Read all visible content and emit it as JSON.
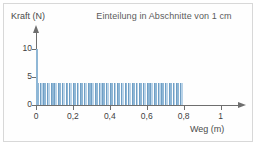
{
  "figure": {
    "width": 257,
    "height": 146,
    "background": "#ffffff",
    "border_color": "#d8d8d8"
  },
  "chart_data": {
    "type": "bar",
    "title": "Einteilung in Abschnitte von 1 cm",
    "xlabel": "Weg (m)",
    "ylabel": "Kraft (N)",
    "xlim": [
      0,
      1.1
    ],
    "ylim": [
      0,
      13
    ],
    "grid": false,
    "legend": null,
    "y_ticks": [
      0,
      5,
      10
    ],
    "y_ticklabels": [
      "0",
      "5",
      "10"
    ],
    "x_ticks": [
      0,
      0.2,
      0.4,
      0.6,
      0.8,
      1.0
    ],
    "x_ticklabels": [
      "0",
      "0,2",
      "0,4",
      "0,6",
      "0,8",
      "1"
    ],
    "bar_fill": "#8fb7d6",
    "bar_fill_alt": "#b9d3e8",
    "bar_edge": "#6f9ec4",
    "axis_color": "#6e6e6e",
    "text_color": "#3f3f3f",
    "title_color": "#5b5b5b",
    "interval_width_m": 0.01,
    "bar_count": 40,
    "bar_height_value": 4,
    "spike": {
      "x": 0.0,
      "value": 10,
      "width_m": 0.008,
      "color": "#8fb7d6"
    },
    "categories": [
      "0,00",
      "0,02",
      "0,04",
      "0,06",
      "0,08",
      "0,10",
      "0,12",
      "0,14",
      "0,16",
      "0,18",
      "0,20",
      "0,22",
      "0,24",
      "0,26",
      "0,28",
      "0,30",
      "0,32",
      "0,34",
      "0,36",
      "0,38",
      "0,40",
      "0,42",
      "0,44",
      "0,46",
      "0,48",
      "0,50",
      "0,52",
      "0,54",
      "0,56",
      "0,58",
      "0,60",
      "0,62",
      "0,64",
      "0,66",
      "0,68",
      "0,70",
      "0,72",
      "0,74",
      "0,76",
      "0,78"
    ],
    "values": [
      4,
      4,
      4,
      4,
      4,
      4,
      4,
      4,
      4,
      4,
      4,
      4,
      4,
      4,
      4,
      4,
      4,
      4,
      4,
      4,
      4,
      4,
      4,
      4,
      4,
      4,
      4,
      4,
      4,
      4,
      4,
      4,
      4,
      4,
      4,
      4,
      4,
      4,
      4,
      4
    ]
  }
}
